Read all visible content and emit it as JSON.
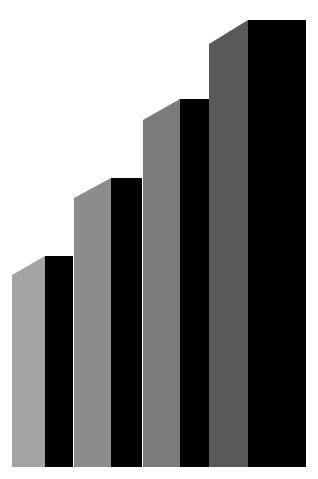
{
  "chart_data": {
    "type": "bar",
    "style": "3d-stepped",
    "title": "",
    "xlabel": "",
    "ylabel": "",
    "categories": [
      "1",
      "2",
      "3",
      "4"
    ],
    "values": [
      211,
      289,
      368,
      447
    ],
    "ylim": [
      0,
      467
    ],
    "grid": false,
    "legend": null,
    "baseline_y": 467,
    "bars": [
      {
        "side_left": 12,
        "front_left": 45,
        "front_right": 73,
        "top_front": 256,
        "top_side": 275,
        "side_color": "#a3a3a3",
        "front_color": "#000000"
      },
      {
        "side_left": 74,
        "front_left": 111,
        "front_right": 142,
        "top_front": 178,
        "top_side": 198,
        "side_color": "#8c8c8c",
        "front_color": "#000000"
      },
      {
        "side_left": 143,
        "front_left": 180,
        "front_right": 209,
        "top_front": 99,
        "top_side": 120,
        "side_color": "#7b7b7b",
        "front_color": "#000000"
      },
      {
        "side_left": 209,
        "front_left": 248,
        "front_right": 306,
        "top_front": 20,
        "top_side": 44,
        "side_color": "#595959",
        "front_color": "#000000"
      }
    ]
  },
  "colors": {
    "background": "#ffffff"
  }
}
